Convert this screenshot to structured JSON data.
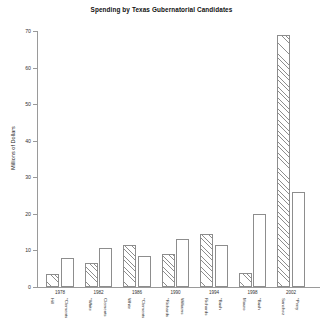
{
  "chart_data": {
    "type": "bar",
    "title": "Spending by Texas Gubernatorial Candidates",
    "xlabel": "",
    "ylabel": "Millions of Dollars",
    "ylim": [
      0,
      70
    ],
    "yticks": [
      0,
      10,
      20,
      30,
      40,
      50,
      60,
      70
    ],
    "ytick_labels": [
      "0",
      "10",
      "20",
      "30",
      "40",
      "50",
      "60",
      "70"
    ],
    "grid": false,
    "legend": "none",
    "categories": [
      "1978",
      "1982",
      "1986",
      "1990",
      "1994",
      "1998",
      "2002"
    ],
    "series": [
      {
        "name": "Democratic candidate",
        "fill": "hatched",
        "values": [
          3.5,
          6.5,
          11.5,
          9.0,
          14.5,
          3.8,
          69.0
        ]
      },
      {
        "name": "Republican candidate",
        "fill": "open",
        "values": [
          7.8,
          10.8,
          8.5,
          13.2,
          11.5,
          20.0,
          26.0
        ]
      }
    ],
    "bars": [
      {
        "year": "1978",
        "candidate": "Hill",
        "value": 3.5,
        "fill": "hatched"
      },
      {
        "year": "1978",
        "candidate": "*Clements",
        "value": 7.8,
        "fill": "open"
      },
      {
        "year": "1982",
        "candidate": "*White",
        "value": 6.5,
        "fill": "hatched"
      },
      {
        "year": "1982",
        "candidate": "Clements",
        "value": 10.8,
        "fill": "open"
      },
      {
        "year": "1986",
        "candidate": "White",
        "value": 11.5,
        "fill": "hatched"
      },
      {
        "year": "1986",
        "candidate": "*Clements",
        "value": 8.5,
        "fill": "open"
      },
      {
        "year": "1990",
        "candidate": "*Richards",
        "value": 9.0,
        "fill": "hatched"
      },
      {
        "year": "1990",
        "candidate": "Williams",
        "value": 13.2,
        "fill": "open"
      },
      {
        "year": "1994",
        "candidate": "Richards",
        "value": 14.5,
        "fill": "hatched"
      },
      {
        "year": "1994",
        "candidate": "*Bush",
        "value": 11.5,
        "fill": "open"
      },
      {
        "year": "1998",
        "candidate": "Mauro",
        "value": 3.8,
        "fill": "hatched"
      },
      {
        "year": "1998",
        "candidate": "*Bush",
        "value": 20.0,
        "fill": "open"
      },
      {
        "year": "2002",
        "candidate": "Sanchez",
        "value": 69.0,
        "fill": "hatched"
      },
      {
        "year": "2002",
        "candidate": "*Perry",
        "value": 26.0,
        "fill": "open"
      }
    ]
  }
}
